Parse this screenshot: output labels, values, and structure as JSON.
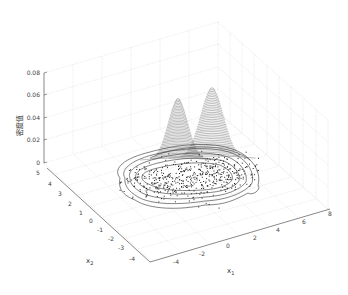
{
  "chart_data": {
    "type": "surface3d",
    "title": "",
    "zlabel": "密度值",
    "xlabel": "x1",
    "ylabel": "x2",
    "zlim": [
      0,
      0.08
    ],
    "xlim": [
      -4,
      8
    ],
    "ylim": [
      -4,
      5
    ],
    "z_ticks": [
      "0",
      "0.02",
      "0.04",
      "0.06",
      "0.08"
    ],
    "x1_ticks": [
      "-4",
      "-2",
      "0",
      "2",
      "4",
      "6",
      "8"
    ],
    "x2_ticks": [
      "5",
      "4",
      "3",
      "2",
      "1",
      "0",
      "-1",
      "-2",
      "-3",
      "-4"
    ],
    "grid": true,
    "peaks": [
      {
        "x1": 0,
        "x2": 0.5,
        "density": 0.052
      },
      {
        "x1": 3.5,
        "x2": 0.5,
        "density": 0.062
      }
    ],
    "colors": {
      "surface": "#333333",
      "grid": "#d8d8d8",
      "axis": "#555555",
      "points": "#222222"
    }
  }
}
